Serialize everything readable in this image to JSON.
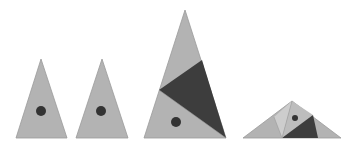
{
  "diagram": {
    "colors": {
      "light": "#b3b3b3",
      "lighter": "#cdcdcd",
      "dark": "#3d3d3d",
      "dot": "#333333",
      "edge": "#9a9a9a"
    },
    "shapes": [
      {
        "name": "triangle-1",
        "label": "Isosceles triangle with dot"
      },
      {
        "name": "triangle-2",
        "label": "Isosceles triangle with dot"
      },
      {
        "name": "triangle-3",
        "label": "Large triangle with dark piece and dot"
      },
      {
        "name": "triangle-4",
        "label": "Flat triangle assembled from pieces"
      }
    ]
  }
}
